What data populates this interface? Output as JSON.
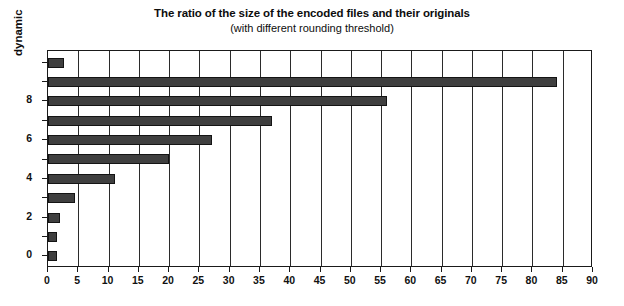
{
  "chart_data": {
    "type": "bar",
    "orientation": "horizontal",
    "title": "The ratio of the size of the encoded files and their originals",
    "subtitle": "(with different rounding threshold)",
    "xlabel": "",
    "ylabel": "dynamic",
    "xlim": [
      0,
      90
    ],
    "ylim": [
      -0.6,
      10.6
    ],
    "grid": "vertical",
    "legend": "none",
    "categories": [
      0,
      1,
      2,
      3,
      4,
      5,
      6,
      7,
      8,
      9,
      10
    ],
    "values": [
      1.5,
      1.5,
      2,
      4.5,
      11,
      20,
      27,
      37,
      56,
      84,
      2.7
    ],
    "xticks": [
      0,
      5,
      10,
      15,
      20,
      25,
      30,
      35,
      40,
      45,
      50,
      55,
      60,
      65,
      70,
      75,
      80,
      85,
      90
    ],
    "xtick_labels": [
      "0",
      "5",
      "10",
      "15",
      "20",
      "25",
      "30",
      "35",
      "40",
      "45",
      "50",
      "55",
      "60",
      "65",
      "70",
      "75",
      "80",
      "85",
      "90"
    ],
    "yticks": [
      0,
      2,
      4,
      6,
      8
    ],
    "ytick_labels": [
      "0",
      "2",
      "4",
      "6",
      "8"
    ],
    "bar_color": "#3f3f3f",
    "bar_edge_color": "#141414",
    "background_color": "#ffffff",
    "axis_color": "#1a1a1a"
  }
}
